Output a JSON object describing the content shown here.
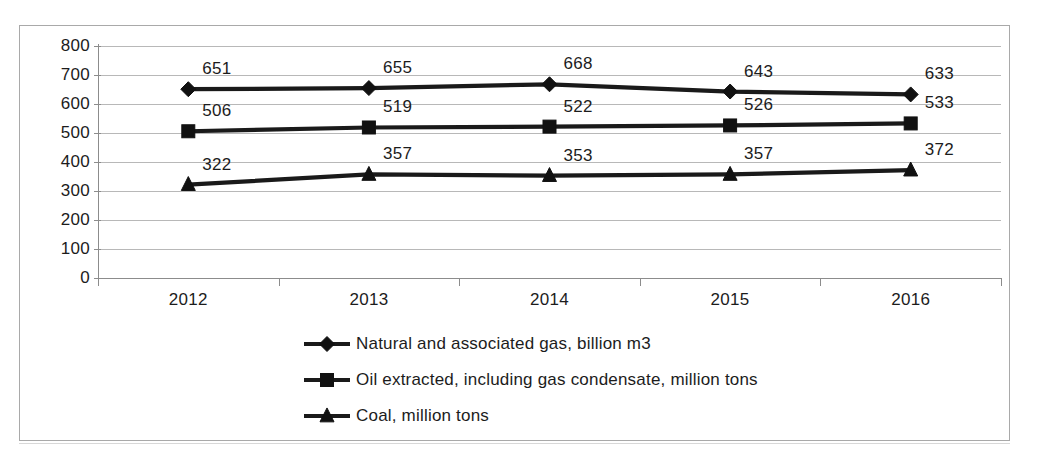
{
  "chart_data": {
    "type": "line",
    "title": "",
    "subtitle": "",
    "xlabel": "",
    "ylabel": "",
    "categories": [
      "2012",
      "2013",
      "2014",
      "2015",
      "2016"
    ],
    "ylim": [
      0,
      800
    ],
    "y_ticks": [
      "800",
      "700",
      "600",
      "500",
      "400",
      "300",
      "200",
      "100",
      "0"
    ],
    "y_tick_values": [
      800,
      700,
      600,
      500,
      400,
      300,
      200,
      100,
      0
    ],
    "grid": true,
    "legend_position": "bottom",
    "series": [
      {
        "name": "Natural and associated gas, billion m3",
        "marker": "diamond",
        "color": "#111111",
        "values": [
          651,
          655,
          668,
          643,
          633
        ],
        "labels": [
          "651",
          "655",
          "668",
          "643",
          "633"
        ]
      },
      {
        "name": "Oil extracted, including gas condensate, million tons",
        "marker": "square",
        "color": "#111111",
        "values": [
          506,
          519,
          522,
          526,
          533
        ],
        "labels": [
          "506",
          "519",
          "522",
          "526",
          "533"
        ]
      },
      {
        "name": "Coal, million tons",
        "marker": "triangle",
        "color": "#111111",
        "values": [
          322,
          357,
          353,
          357,
          372
        ],
        "labels": [
          "322",
          "357",
          "353",
          "357",
          "372"
        ]
      }
    ]
  }
}
